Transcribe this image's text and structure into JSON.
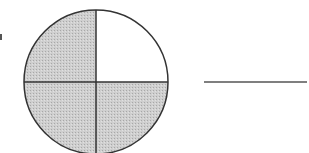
{
  "figure": {
    "circle": {
      "parts": 4,
      "shaded_parts": 3,
      "unshaded_quadrant": "top-right",
      "shade_color": "#c8c8c8",
      "stroke_color": "#333333"
    },
    "answer_line": {
      "blank": ""
    }
  }
}
